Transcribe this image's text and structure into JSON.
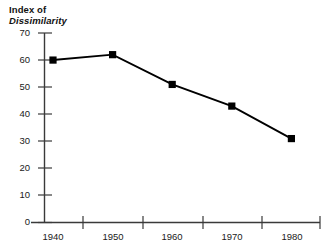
{
  "chart_data": {
    "type": "line",
    "title": "Index of Dissimilarity",
    "title_lines": [
      "Index of",
      "Dissimilarity"
    ],
    "xlabel": "",
    "ylabel": "Index of Dissimilarity",
    "categories": [
      "1940",
      "1950",
      "1960",
      "1970",
      "1980"
    ],
    "values": [
      60,
      62,
      51,
      43,
      31
    ],
    "series": [
      {
        "name": "Index of Dissimilarity",
        "values": [
          60,
          62,
          51,
          43,
          31
        ]
      }
    ],
    "ylim": [
      0,
      70
    ],
    "ytick_labels": [
      "70",
      "60",
      "50",
      "40",
      "30",
      "20",
      "10",
      "0"
    ],
    "ytick_values": [
      70,
      60,
      50,
      40,
      30,
      20,
      10,
      0
    ],
    "xtick_labels": [
      "1940",
      "1950",
      "1960",
      "1970",
      "1980"
    ],
    "grid": false,
    "legend": "none",
    "marker": "filled-square",
    "line_color": "#000000",
    "marker_color": "#000000",
    "axis_color": "#3a3a3a",
    "background_color": "#ffffff"
  },
  "points": [
    {
      "x": "1940",
      "y": 60,
      "label": "1940"
    },
    {
      "x": "1950",
      "y": 62,
      "label": "1950"
    },
    {
      "x": "1960",
      "y": 51,
      "label": "1960"
    },
    {
      "x": "1970",
      "y": 43,
      "label": "1970"
    },
    {
      "x": "1980",
      "y": 31,
      "label": "1980"
    }
  ]
}
